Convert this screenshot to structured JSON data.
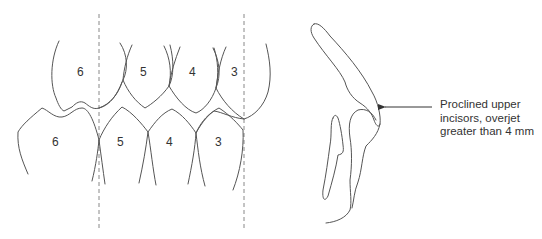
{
  "figure": {
    "left_panel": {
      "title": "Dental arch, lateral view",
      "upper_teeth": [
        {
          "label": "6"
        },
        {
          "label": "5"
        },
        {
          "label": "4"
        },
        {
          "label": "3"
        }
      ],
      "lower_teeth": [
        {
          "label": "6"
        },
        {
          "label": "5"
        },
        {
          "label": "4"
        },
        {
          "label": "3"
        }
      ],
      "reference_lines": 2
    },
    "right_panel": {
      "title": "Incisor profile",
      "annotation": {
        "lines": [
          "Proclined upper",
          "incisors, overjet",
          "greater than 4 mm"
        ]
      }
    },
    "colors": {
      "stroke": "#555555",
      "dashed": "#888888",
      "text": "#333333",
      "background": "#ffffff"
    }
  }
}
